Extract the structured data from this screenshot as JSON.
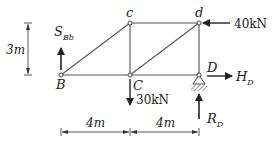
{
  "diagram": {
    "type": "truss",
    "nodes": [
      {
        "id": "B",
        "label": "B"
      },
      {
        "id": "C",
        "label": "C"
      },
      {
        "id": "D",
        "label": "D"
      },
      {
        "id": "c",
        "label": "c"
      },
      {
        "id": "d",
        "label": "d"
      }
    ],
    "members": [
      [
        "B",
        "C"
      ],
      [
        "C",
        "D"
      ],
      [
        "c",
        "d"
      ],
      [
        "B",
        "c"
      ],
      [
        "c",
        "C"
      ],
      [
        "C",
        "d"
      ],
      [
        "d",
        "D"
      ]
    ],
    "loads": {
      "at_d": {
        "value": "40kN",
        "direction": "left"
      },
      "at_C": {
        "value": "30kN",
        "direction": "down"
      }
    },
    "reactions": {
      "S_Bb": {
        "symbol": "S",
        "subscript": "Bb",
        "direction": "up"
      },
      "H_D": {
        "symbol": "H",
        "subscript": "D",
        "direction": "right"
      },
      "R_D": {
        "symbol": "R",
        "subscript": "D",
        "direction": "up"
      }
    },
    "dimensions": {
      "height": "3m",
      "span_left": "4m",
      "span_right": "4m"
    },
    "colors": {
      "line": "#444444",
      "text": "#222222",
      "background": "#ffffff"
    }
  }
}
